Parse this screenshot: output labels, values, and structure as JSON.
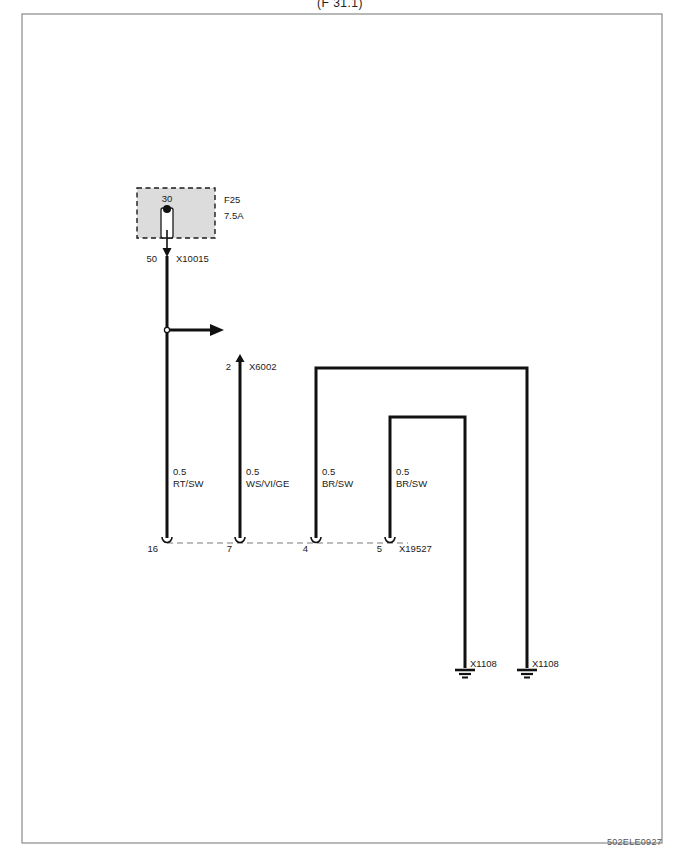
{
  "page": {
    "header_text": "(F 31.1)",
    "footer_code": "502ELE0927",
    "frame": {
      "x": 22,
      "y": 14,
      "width": 640,
      "height": 829
    }
  },
  "fuse_block": {
    "box": {
      "x": 137,
      "y": 188,
      "width": 78,
      "height": 50
    },
    "fill_color": "#dcdcdc",
    "border_style": "dashed",
    "top_pin_label": "30",
    "fuse_name": "F25",
    "fuse_rating": "7.5A",
    "output_pin_label": "50",
    "output_connector": "X10015"
  },
  "junction": {
    "dot_x": 167,
    "dot_y": 330,
    "arrow_end_x": 222,
    "label": ""
  },
  "connectors": {
    "x6002": {
      "pin": "2",
      "name": "X6002"
    },
    "x19527": {
      "name": "X19527"
    },
    "ground_left": {
      "name": "X1108"
    },
    "ground_right": {
      "name": "X1108"
    }
  },
  "wires": [
    {
      "id": "wire-rt-sw",
      "gauge": "0.5",
      "colors": "RT/SW",
      "pin": "16",
      "x": 167,
      "label_x": 173,
      "label_y": 473
    },
    {
      "id": "wire-ws-vi-ge",
      "gauge": "0.5",
      "colors": "WS/VI/GE",
      "pin": "7",
      "x": 240,
      "label_x": 246,
      "label_y": 473
    },
    {
      "id": "wire-br-sw-1",
      "gauge": "0.5",
      "colors": "BR/SW",
      "pin": "4",
      "x": 316,
      "label_x": 322,
      "label_y": 473
    },
    {
      "id": "wire-br-sw-2",
      "gauge": "0.5",
      "colors": "BR/SW",
      "pin": "5",
      "x": 390,
      "label_x": 396,
      "label_y": 473
    }
  ],
  "routing": {
    "outer_path_top_y": 368,
    "outer_path_right_x": 527,
    "inner_path_top_y": 417,
    "inner_path_right_x": 465,
    "ground_y": 673,
    "connector_row_y": 543
  },
  "colors": {
    "wire": "#111111",
    "frame": "#8a8a8a",
    "dashed": "#9a9a9a",
    "text": "#1a1a1a"
  }
}
